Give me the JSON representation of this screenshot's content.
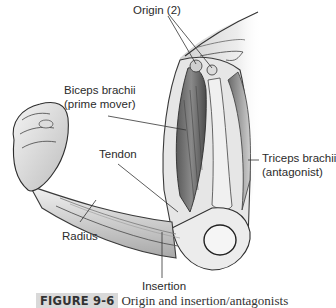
{
  "figure": {
    "labels": {
      "origin": "Origin (2)",
      "biceps_line1": "Biceps brachii",
      "biceps_line2": "(prime mover)",
      "tendon": "Tendon",
      "triceps_line1": "Triceps brachii",
      "triceps_line2": "(antagonist)",
      "radius": "Radius",
      "insertion": "Insertion"
    },
    "caption": {
      "number": "FIGURE 9-6",
      "title": "Origin and insertion/antagonists"
    },
    "colors": {
      "background": "#ffffff",
      "label_text": "#2b2b2b",
      "leader_line": "#333333",
      "caption_badge": "#d9d9d9"
    }
  }
}
